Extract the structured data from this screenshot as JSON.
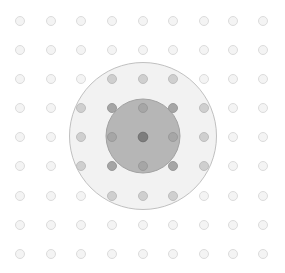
{
  "canvas": {
    "width": 285,
    "height": 273,
    "background_color": "#ffffff"
  },
  "chart_data": {
    "type": "scatter",
    "title": "",
    "subtitle": "",
    "xlabel": "",
    "ylabel": "",
    "grid": true,
    "legend": "none",
    "xlim": [
      0,
      285
    ],
    "ylim": [
      0,
      273
    ],
    "grid_spec": {
      "columns": 9,
      "rows": 9,
      "column_centers_px": [
        20,
        51,
        81,
        112,
        143,
        173,
        204,
        233,
        263
      ],
      "row_centers_px": [
        21,
        50,
        79,
        108,
        137,
        166,
        196,
        225,
        254
      ],
      "column_spacing_px": 30.4,
      "row_spacing_px": 29.1,
      "dot_diameter_px": 9
    },
    "regions": [
      {
        "name": "outer-circle",
        "center_px": [
          143,
          136
        ],
        "radius_px": 73.5,
        "fill": "#f2f2f2",
        "stroke": "#c0c0c0",
        "stroke_width": 1
      },
      {
        "name": "inner-circle",
        "center_px": [
          143,
          136
        ],
        "radius_px": 37,
        "fill": "#b6b6b6",
        "stroke": "#a2a2a2",
        "stroke_width": 1
      }
    ],
    "point_styles": [
      {
        "name": "background-dot",
        "fill": "#f4f4f4",
        "stroke": "#dcdcdc",
        "radius_px": 4.5
      },
      {
        "name": "outer-region-dot",
        "fill": "#cfcfcf",
        "stroke": "#bebebe",
        "radius_px": 4.5
      },
      {
        "name": "inner-region-dot",
        "fill": "#a6a6a6",
        "stroke": "#9a9a9a",
        "radius_px": 4.5
      },
      {
        "name": "center-dot",
        "fill": "#7d7d7d",
        "stroke": "#707070",
        "radius_px": 4.8
      }
    ],
    "points": [
      {
        "col": 0,
        "row": 0,
        "x": 20,
        "y": 21,
        "region": "background",
        "style": "background-dot"
      },
      {
        "col": 1,
        "row": 0,
        "x": 51,
        "y": 21,
        "region": "background",
        "style": "background-dot"
      },
      {
        "col": 2,
        "row": 0,
        "x": 81,
        "y": 21,
        "region": "background",
        "style": "background-dot"
      },
      {
        "col": 3,
        "row": 0,
        "x": 112,
        "y": 21,
        "region": "background",
        "style": "background-dot"
      },
      {
        "col": 4,
        "row": 0,
        "x": 143,
        "y": 21,
        "region": "background",
        "style": "background-dot"
      },
      {
        "col": 5,
        "row": 0,
        "x": 173,
        "y": 21,
        "region": "background",
        "style": "background-dot"
      },
      {
        "col": 6,
        "row": 0,
        "x": 204,
        "y": 21,
        "region": "background",
        "style": "background-dot"
      },
      {
        "col": 7,
        "row": 0,
        "x": 233,
        "y": 21,
        "region": "background",
        "style": "background-dot"
      },
      {
        "col": 8,
        "row": 0,
        "x": 263,
        "y": 21,
        "region": "background",
        "style": "background-dot"
      },
      {
        "col": 0,
        "row": 1,
        "x": 20,
        "y": 50,
        "region": "background",
        "style": "background-dot"
      },
      {
        "col": 1,
        "row": 1,
        "x": 51,
        "y": 50,
        "region": "background",
        "style": "background-dot"
      },
      {
        "col": 2,
        "row": 1,
        "x": 81,
        "y": 50,
        "region": "background",
        "style": "background-dot"
      },
      {
        "col": 3,
        "row": 1,
        "x": 112,
        "y": 50,
        "region": "background",
        "style": "background-dot"
      },
      {
        "col": 4,
        "row": 1,
        "x": 143,
        "y": 50,
        "region": "background",
        "style": "background-dot"
      },
      {
        "col": 5,
        "row": 1,
        "x": 173,
        "y": 50,
        "region": "background",
        "style": "background-dot"
      },
      {
        "col": 6,
        "row": 1,
        "x": 204,
        "y": 50,
        "region": "background",
        "style": "background-dot"
      },
      {
        "col": 7,
        "row": 1,
        "x": 233,
        "y": 50,
        "region": "background",
        "style": "background-dot"
      },
      {
        "col": 8,
        "row": 1,
        "x": 263,
        "y": 50,
        "region": "background",
        "style": "background-dot"
      },
      {
        "col": 0,
        "row": 2,
        "x": 20,
        "y": 79,
        "region": "background",
        "style": "background-dot"
      },
      {
        "col": 1,
        "row": 2,
        "x": 51,
        "y": 79,
        "region": "background",
        "style": "background-dot"
      },
      {
        "col": 2,
        "row": 2,
        "x": 81,
        "y": 79,
        "region": "background",
        "style": "background-dot"
      },
      {
        "col": 3,
        "row": 2,
        "x": 112,
        "y": 79,
        "region": "outer",
        "style": "outer-region-dot"
      },
      {
        "col": 4,
        "row": 2,
        "x": 143,
        "y": 79,
        "region": "outer",
        "style": "outer-region-dot"
      },
      {
        "col": 5,
        "row": 2,
        "x": 173,
        "y": 79,
        "region": "outer",
        "style": "outer-region-dot"
      },
      {
        "col": 6,
        "row": 2,
        "x": 204,
        "y": 79,
        "region": "background",
        "style": "background-dot"
      },
      {
        "col": 7,
        "row": 2,
        "x": 233,
        "y": 79,
        "region": "background",
        "style": "background-dot"
      },
      {
        "col": 8,
        "row": 2,
        "x": 263,
        "y": 79,
        "region": "background",
        "style": "background-dot"
      },
      {
        "col": 0,
        "row": 3,
        "x": 20,
        "y": 108,
        "region": "background",
        "style": "background-dot"
      },
      {
        "col": 1,
        "row": 3,
        "x": 51,
        "y": 108,
        "region": "background",
        "style": "background-dot"
      },
      {
        "col": 2,
        "row": 3,
        "x": 81,
        "y": 108,
        "region": "outer",
        "style": "outer-region-dot"
      },
      {
        "col": 3,
        "row": 3,
        "x": 112,
        "y": 108,
        "region": "inner",
        "style": "inner-region-dot"
      },
      {
        "col": 4,
        "row": 3,
        "x": 143,
        "y": 108,
        "region": "inner",
        "style": "inner-region-dot"
      },
      {
        "col": 5,
        "row": 3,
        "x": 173,
        "y": 108,
        "region": "inner",
        "style": "inner-region-dot"
      },
      {
        "col": 6,
        "row": 3,
        "x": 204,
        "y": 108,
        "region": "outer",
        "style": "outer-region-dot"
      },
      {
        "col": 7,
        "row": 3,
        "x": 233,
        "y": 108,
        "region": "background",
        "style": "background-dot"
      },
      {
        "col": 8,
        "row": 3,
        "x": 263,
        "y": 108,
        "region": "background",
        "style": "background-dot"
      },
      {
        "col": 0,
        "row": 4,
        "x": 20,
        "y": 137,
        "region": "background",
        "style": "background-dot"
      },
      {
        "col": 1,
        "row": 4,
        "x": 51,
        "y": 137,
        "region": "background",
        "style": "background-dot"
      },
      {
        "col": 2,
        "row": 4,
        "x": 81,
        "y": 137,
        "region": "outer",
        "style": "outer-region-dot"
      },
      {
        "col": 3,
        "row": 4,
        "x": 112,
        "y": 137,
        "region": "inner",
        "style": "inner-region-dot"
      },
      {
        "col": 4,
        "row": 4,
        "x": 143,
        "y": 137,
        "region": "center",
        "style": "center-dot"
      },
      {
        "col": 5,
        "row": 4,
        "x": 173,
        "y": 137,
        "region": "inner",
        "style": "inner-region-dot"
      },
      {
        "col": 6,
        "row": 4,
        "x": 204,
        "y": 137,
        "region": "outer",
        "style": "outer-region-dot"
      },
      {
        "col": 7,
        "row": 4,
        "x": 233,
        "y": 137,
        "region": "background",
        "style": "background-dot"
      },
      {
        "col": 8,
        "row": 4,
        "x": 263,
        "y": 137,
        "region": "background",
        "style": "background-dot"
      },
      {
        "col": 0,
        "row": 5,
        "x": 20,
        "y": 166,
        "region": "background",
        "style": "background-dot"
      },
      {
        "col": 1,
        "row": 5,
        "x": 51,
        "y": 166,
        "region": "background",
        "style": "background-dot"
      },
      {
        "col": 2,
        "row": 5,
        "x": 81,
        "y": 166,
        "region": "outer",
        "style": "outer-region-dot"
      },
      {
        "col": 3,
        "row": 5,
        "x": 112,
        "y": 166,
        "region": "inner",
        "style": "inner-region-dot"
      },
      {
        "col": 4,
        "row": 5,
        "x": 143,
        "y": 166,
        "region": "inner",
        "style": "inner-region-dot"
      },
      {
        "col": 5,
        "row": 5,
        "x": 173,
        "y": 166,
        "region": "inner",
        "style": "inner-region-dot"
      },
      {
        "col": 6,
        "row": 5,
        "x": 204,
        "y": 166,
        "region": "outer",
        "style": "outer-region-dot"
      },
      {
        "col": 7,
        "row": 5,
        "x": 233,
        "y": 166,
        "region": "background",
        "style": "background-dot"
      },
      {
        "col": 8,
        "row": 5,
        "x": 263,
        "y": 166,
        "region": "background",
        "style": "background-dot"
      },
      {
        "col": 0,
        "row": 6,
        "x": 20,
        "y": 196,
        "region": "background",
        "style": "background-dot"
      },
      {
        "col": 1,
        "row": 6,
        "x": 51,
        "y": 196,
        "region": "background",
        "style": "background-dot"
      },
      {
        "col": 2,
        "row": 6,
        "x": 81,
        "y": 196,
        "region": "background",
        "style": "background-dot"
      },
      {
        "col": 3,
        "row": 6,
        "x": 112,
        "y": 196,
        "region": "outer",
        "style": "outer-region-dot"
      },
      {
        "col": 4,
        "row": 6,
        "x": 143,
        "y": 196,
        "region": "outer",
        "style": "outer-region-dot"
      },
      {
        "col": 5,
        "row": 6,
        "x": 173,
        "y": 196,
        "region": "outer",
        "style": "outer-region-dot"
      },
      {
        "col": 6,
        "row": 6,
        "x": 204,
        "y": 196,
        "region": "background",
        "style": "background-dot"
      },
      {
        "col": 7,
        "row": 6,
        "x": 233,
        "y": 196,
        "region": "background",
        "style": "background-dot"
      },
      {
        "col": 8,
        "row": 6,
        "x": 263,
        "y": 196,
        "region": "background",
        "style": "background-dot"
      },
      {
        "col": 0,
        "row": 7,
        "x": 20,
        "y": 225,
        "region": "background",
        "style": "background-dot"
      },
      {
        "col": 1,
        "row": 7,
        "x": 51,
        "y": 225,
        "region": "background",
        "style": "background-dot"
      },
      {
        "col": 2,
        "row": 7,
        "x": 81,
        "y": 225,
        "region": "background",
        "style": "background-dot"
      },
      {
        "col": 3,
        "row": 7,
        "x": 112,
        "y": 225,
        "region": "background",
        "style": "background-dot"
      },
      {
        "col": 4,
        "row": 7,
        "x": 143,
        "y": 225,
        "region": "background",
        "style": "background-dot"
      },
      {
        "col": 5,
        "row": 7,
        "x": 173,
        "y": 225,
        "region": "background",
        "style": "background-dot"
      },
      {
        "col": 6,
        "row": 7,
        "x": 204,
        "y": 225,
        "region": "background",
        "style": "background-dot"
      },
      {
        "col": 7,
        "row": 7,
        "x": 233,
        "y": 225,
        "region": "background",
        "style": "background-dot"
      },
      {
        "col": 8,
        "row": 7,
        "x": 263,
        "y": 225,
        "region": "background",
        "style": "background-dot"
      },
      {
        "col": 0,
        "row": 8,
        "x": 20,
        "y": 254,
        "region": "background",
        "style": "background-dot"
      },
      {
        "col": 1,
        "row": 8,
        "x": 51,
        "y": 254,
        "region": "background",
        "style": "background-dot"
      },
      {
        "col": 2,
        "row": 8,
        "x": 81,
        "y": 254,
        "region": "background",
        "style": "background-dot"
      },
      {
        "col": 3,
        "row": 8,
        "x": 112,
        "y": 254,
        "region": "background",
        "style": "background-dot"
      },
      {
        "col": 4,
        "row": 8,
        "x": 143,
        "y": 254,
        "region": "background",
        "style": "background-dot"
      },
      {
        "col": 5,
        "row": 8,
        "x": 173,
        "y": 254,
        "region": "background",
        "style": "background-dot"
      },
      {
        "col": 6,
        "row": 8,
        "x": 204,
        "y": 254,
        "region": "background",
        "style": "background-dot"
      },
      {
        "col": 7,
        "row": 8,
        "x": 233,
        "y": 254,
        "region": "background",
        "style": "background-dot"
      },
      {
        "col": 8,
        "row": 8,
        "x": 263,
        "y": 254,
        "region": "background",
        "style": "background-dot"
      }
    ]
  }
}
